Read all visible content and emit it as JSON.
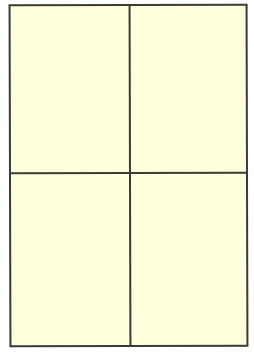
{
  "diagram": {
    "type": "quadrant-grid",
    "rows": 2,
    "columns": 2,
    "colors": {
      "fill": "#ffffdd",
      "stroke": "#3a3a3a",
      "background": "#ffffff"
    },
    "quadrants": [
      {
        "position": "top-left",
        "label": ""
      },
      {
        "position": "top-right",
        "label": ""
      },
      {
        "position": "bottom-left",
        "label": ""
      },
      {
        "position": "bottom-right",
        "label": ""
      }
    ]
  }
}
